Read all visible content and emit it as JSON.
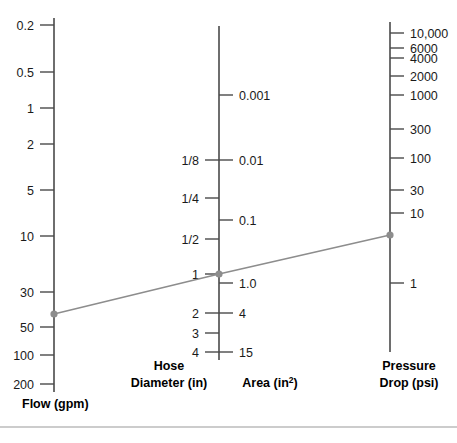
{
  "chart_data": {
    "type": "line",
    "title": "",
    "subtitle": "",
    "grid": false,
    "legend_position": "none",
    "axes": [
      {
        "id": "flow",
        "name": "flow-scale",
        "title_lines": [
          "Flow (gpm)"
        ],
        "units": "gpm",
        "orientation": "vertical",
        "label_side": "left",
        "tick_side": "left",
        "scale": "log-descending",
        "ticks": [
          {
            "label": "0.2",
            "value": 0.2,
            "y": 25
          },
          {
            "label": "0.5",
            "value": 0.5,
            "y": 72
          },
          {
            "label": "1",
            "value": 1,
            "y": 108
          },
          {
            "label": "2",
            "value": 2,
            "y": 144
          },
          {
            "label": "5",
            "value": 5,
            "y": 190
          },
          {
            "label": "10",
            "value": 10,
            "y": 236
          },
          {
            "label": "30",
            "value": 30,
            "y": 292
          },
          {
            "label": "50",
            "value": 50,
            "y": 327
          },
          {
            "label": "100",
            "value": 100,
            "y": 355
          },
          {
            "label": "200",
            "value": 200,
            "y": 384
          }
        ],
        "marker": {
          "label": "40",
          "value": 40,
          "y": 314
        }
      },
      {
        "id": "hose-diameter",
        "name": "hose-diameter-scale",
        "title_lines": [
          "Hose",
          "Diameter (in)"
        ],
        "units": "in",
        "orientation": "vertical",
        "label_side": "left",
        "tick_side": "left",
        "scale": "log-descending",
        "ticks": [
          {
            "label": "1/8",
            "value": 0.125,
            "y": 160
          },
          {
            "label": "1/4",
            "value": 0.25,
            "y": 198
          },
          {
            "label": "1/2",
            "value": 0.5,
            "y": 239
          },
          {
            "label": "1",
            "value": 1,
            "y": 274
          },
          {
            "label": "2",
            "value": 2,
            "y": 313
          },
          {
            "label": "3",
            "value": 3,
            "y": 333
          },
          {
            "label": "4",
            "value": 4,
            "y": 352
          }
        ],
        "marker": {
          "label": "1",
          "value": 1,
          "y": 274
        }
      },
      {
        "id": "area",
        "name": "area-scale",
        "title_lines": [
          "Area (in²)"
        ],
        "units": "in²",
        "orientation": "vertical",
        "label_side": "right",
        "tick_side": "right",
        "scale": "log-ascending",
        "ticks": [
          {
            "label": "0.001",
            "value": 0.001,
            "y": 95
          },
          {
            "label": "0.01",
            "value": 0.01,
            "y": 160
          },
          {
            "label": "0.1",
            "value": 0.1,
            "y": 220
          },
          {
            "label": "1.0",
            "value": 1.0,
            "y": 283
          },
          {
            "label": "4",
            "value": 4,
            "y": 313
          },
          {
            "label": "15",
            "value": 15,
            "y": 352
          }
        ],
        "marker": {
          "label": "1.0",
          "value": 1.0,
          "y": 274
        }
      },
      {
        "id": "pressure-drop",
        "name": "pressure-drop-scale",
        "title_lines": [
          "Pressure",
          "Drop (psi)"
        ],
        "units": "psi",
        "orientation": "vertical",
        "label_side": "right",
        "tick_side": "right",
        "scale": "log-descending",
        "ticks": [
          {
            "label": "10,000",
            "value": 10000,
            "y": 33
          },
          {
            "label": "6000",
            "value": 6000,
            "y": 48
          },
          {
            "label": "4000",
            "value": 4000,
            "y": 58
          },
          {
            "label": "2000",
            "value": 2000,
            "y": 76
          },
          {
            "label": "1000",
            "value": 1000,
            "y": 95
          },
          {
            "label": "300",
            "value": 300,
            "y": 129
          },
          {
            "label": "100",
            "value": 100,
            "y": 158
          },
          {
            "label": "30",
            "value": 30,
            "y": 190
          },
          {
            "label": "10",
            "value": 10,
            "y": 213
          },
          {
            "label": "1",
            "value": 1,
            "y": 283
          }
        ],
        "marker": {
          "label": "5",
          "value": 5,
          "y": 235
        }
      }
    ],
    "index_line": {
      "name": "index-line",
      "points": [
        {
          "axis": "flow",
          "x": 54,
          "y": 314
        },
        {
          "axis": "hose-diameter",
          "x": 219,
          "y": 274
        },
        {
          "axis": "pressure-drop",
          "x": 390,
          "y": 235
        }
      ],
      "color": "#8d8d8d"
    }
  },
  "colors": {
    "axis": "#4a4a4a",
    "index_line": "#8d8d8d",
    "marker": "#8d8d8d",
    "text": "#1a1a1a",
    "baseline": "#9a9a9a",
    "background": "#ffffff"
  },
  "labels": {
    "flow_title": "Flow (gpm)",
    "hose_title_line1": "Hose",
    "hose_title_line2": "Diameter (in)",
    "area_title_main": "Area (in",
    "area_title_sup": "2",
    "area_title_close": ")",
    "pressure_title_line1": "Pressure",
    "pressure_title_line2": "Drop (psi)"
  }
}
